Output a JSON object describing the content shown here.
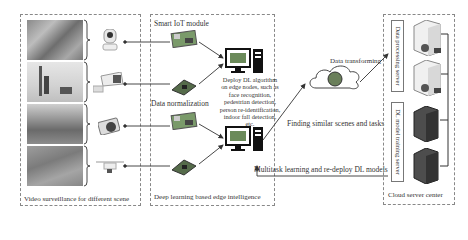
{
  "panels": {
    "video": {
      "caption": "Video surveillance for different scene"
    },
    "edge": {
      "caption": "Deep learning based edge intelligence",
      "module_label": "Smart IoT module",
      "normalization_label": "Data normalization",
      "deploy_description_lines": [
        "Deploy DL algorithm",
        "on edge nodes, such as",
        "face recognition,",
        "pedestrian detection,",
        "person re-identification,",
        "indoor fall detection,",
        "etc."
      ]
    },
    "cloud": {
      "caption": "Cloud server center",
      "data_server_label": "Data processing server",
      "training_server_label": "DL model training server"
    }
  },
  "flow": {
    "data_transforming": "Data transforming",
    "finding_similar": "Finding similar scenes and tasks",
    "feedback": "Multitask learning and re-deploy DL models"
  },
  "scenes": [
    {
      "name": "indoor-scene"
    },
    {
      "name": "street-scene"
    },
    {
      "name": "park-scene"
    },
    {
      "name": "aerial-scene"
    }
  ],
  "devices": [
    {
      "icon": "dome-camera-icon"
    },
    {
      "icon": "bullet-camera-icon"
    },
    {
      "icon": "compact-camera-icon"
    },
    {
      "icon": "drone-icon"
    }
  ],
  "colors": {
    "border": "#888888",
    "arrow": "#333333",
    "text": "#333333"
  }
}
